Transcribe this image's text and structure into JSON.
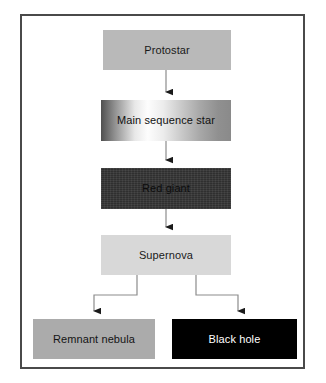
{
  "diagram": {
    "background_color": "#ffffff",
    "frame_border_color": "#4a4a4a",
    "connector_color": "#8c8c8c",
    "arrowhead_color": "#1a1a1a",
    "nodes": [
      {
        "id": "protostar",
        "label": "Protostar",
        "fill": "#b9b9b9",
        "text_color": "#1a1a1a"
      },
      {
        "id": "main_sequence_star",
        "label": "Main sequence star",
        "fill": "gradient-dark-to-white-to-gray",
        "text_color": "#111111"
      },
      {
        "id": "red_giant",
        "label": "Red giant",
        "fill": "#343434",
        "text_color": "#0c0c0c"
      },
      {
        "id": "supernova",
        "label": "Supernova",
        "fill": "#d8d8d8",
        "text_color": "#1a1a1a"
      },
      {
        "id": "remnant_nebula",
        "label": "Remnant nebula",
        "fill": "#ababab",
        "text_color": "#141414"
      },
      {
        "id": "black_hole",
        "label": "Black hole",
        "fill": "#000000",
        "text_color": "#ffffff"
      }
    ],
    "edges": [
      {
        "from": "protostar",
        "to": "main_sequence_star",
        "shape": "straight-down"
      },
      {
        "from": "main_sequence_star",
        "to": "red_giant",
        "shape": "straight-down"
      },
      {
        "from": "red_giant",
        "to": "supernova",
        "shape": "straight-down"
      },
      {
        "from": "supernova",
        "to": "remnant_nebula",
        "shape": "elbow-left"
      },
      {
        "from": "supernova",
        "to": "black_hole",
        "shape": "elbow-right"
      }
    ]
  }
}
